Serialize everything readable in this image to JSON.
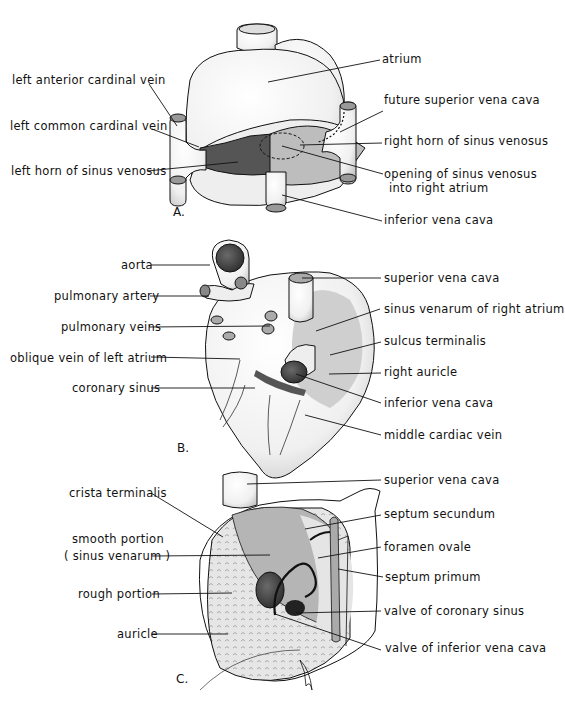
{
  "figure": {
    "panels": [
      {
        "letter": "A.",
        "left_labels": [
          "left anterior cardinal vein",
          "left common cardinal vein",
          "left horn of sinus venosus"
        ],
        "right_labels": [
          "atrium",
          "future superior vena cava",
          "right horn of sinus venosus",
          "opening of sinus venosus",
          "into right atrium",
          "inferior vena cava"
        ]
      },
      {
        "letter": "B.",
        "left_labels": [
          "aorta",
          "pulmonary artery",
          "pulmonary veins",
          "oblique vein of left atrium",
          "coronary sinus"
        ],
        "right_labels": [
          "superior vena cava",
          "sinus venarum of right atrium",
          "sulcus terminalis",
          "right  auricle",
          "inferior vena cava",
          "middle cardiac vein"
        ]
      },
      {
        "letter": "C.",
        "left_labels": [
          "crista terminalis",
          "smooth portion",
          "( sinus venarum )",
          "rough portion",
          "auricle"
        ],
        "right_labels": [
          "superior vena cava",
          "septum secundum",
          "foramen ovale",
          "septum primum",
          "valve of coronary sinus",
          "valve of inferior vena cava"
        ]
      }
    ],
    "colors": {
      "ink": "#111111",
      "shade_light": "#d4d4d4",
      "shade_mid": "#a8a8a8",
      "shade_dark": "#5a5a5a",
      "paper": "#ffffff"
    }
  }
}
